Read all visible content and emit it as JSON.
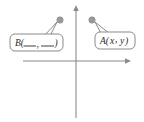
{
  "figure": {
    "type": "coordinate-plane-diagram",
    "width": 144,
    "height": 122,
    "background_color": "#ffffff"
  },
  "axes": {
    "x_axis": {
      "name": "horizontal-axis",
      "y_position": 61,
      "x_start": 23,
      "x_end": 131,
      "arrow": "right",
      "color": "#8a8a8a",
      "tick_labels": []
    },
    "y_axis": {
      "name": "vertical-axis",
      "x_position": 76,
      "y_start": 5,
      "y_end": 118,
      "arrow": "up",
      "color": "#8a8a8a",
      "tick_labels": []
    },
    "origin": {
      "x": 76,
      "y": 61
    }
  },
  "points": [
    {
      "id": "point-b",
      "marker_color": "#9a9a9a",
      "cx": 60,
      "cy": 20,
      "r": 3.2,
      "quadrant": "II"
    },
    {
      "id": "point-a",
      "marker_color": "#9a9a9a",
      "cx": 92,
      "cy": 20,
      "r": 3.2,
      "quadrant": "I"
    }
  ],
  "callouts": [
    {
      "id": "callout-b",
      "label_prefix": "B(",
      "label_suffix": ")",
      "label_separator": ",",
      "label_full": "B(___, ___)",
      "blanks": 2,
      "box": {
        "x": 10,
        "y": 34,
        "width": 53,
        "height": 17,
        "rx": 5
      },
      "text_x": 16,
      "text_y": 43,
      "tail_points": "44,36 57,22 48,40",
      "points_to": "point-b"
    },
    {
      "id": "callout-a",
      "label_prefix": "A(",
      "label_suffix": ")",
      "label_separator": ",",
      "label_full": "A(x, y)",
      "label_var_x": "x",
      "label_var_y": "y",
      "blanks": 0,
      "box": {
        "x": 95,
        "y": 32,
        "width": 40,
        "height": 17,
        "rx": 5
      },
      "text_x": 100,
      "text_y": 41,
      "tail_points": "110,34 95,22 103,37",
      "points_to": "point-a"
    }
  ]
}
